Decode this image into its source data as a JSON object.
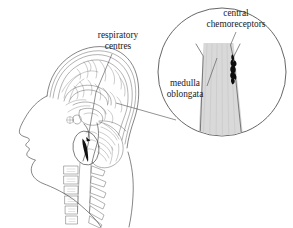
{
  "figure": {
    "background_color": "#ffffff",
    "ink_color": "#3a3a3a",
    "medulla_fill_color": "#d9d9d9",
    "chemoreceptor_color": "#0d0d0d"
  },
  "labels": {
    "respiratory_centres": {
      "line1": "respiratory",
      "line2": "centres"
    },
    "central_chemoreceptors": {
      "line1": "central",
      "line2": "chemoreceptors"
    },
    "medulla_oblongata": {
      "line1": "medulla",
      "line2": "oblongata"
    }
  },
  "parts": {
    "head_profile": "sagittal head profile",
    "cerebrum": "cerebrum",
    "cerebellum": "cerebellum",
    "brainstem": "brainstem",
    "spinal_column": "cervical vertebrae",
    "inset_circle": "magnified view of medulla oblongata",
    "highlight_ellipse": "respiratory centre highlight"
  }
}
